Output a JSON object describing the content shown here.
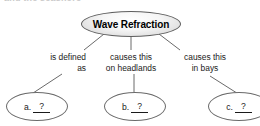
{
  "page": {
    "background_color": "#ffffff",
    "clipped_heading_text": "and the seashore"
  },
  "diagram": {
    "type": "concept-map",
    "root": {
      "label": "Wave Refraction",
      "shape": "ellipse",
      "fill": "gradient-gray",
      "border_color": "#5e5e5e"
    },
    "branches": [
      {
        "id": "a",
        "caption_line1": "is defined",
        "caption_line2": "as",
        "answer_letter": "a.",
        "answer_blank": "?"
      },
      {
        "id": "b",
        "caption_line1": "causes this",
        "caption_line2": "on headlands",
        "answer_letter": "b.",
        "answer_blank": "?"
      },
      {
        "id": "c",
        "caption_line1": "causes this",
        "caption_line2": "in bays",
        "answer_letter": "c.",
        "answer_blank": "?"
      }
    ],
    "edge_color": "#6a6a6a"
  }
}
